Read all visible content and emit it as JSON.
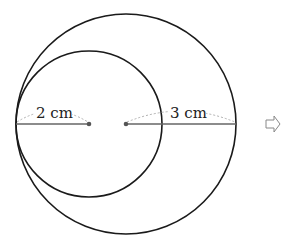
{
  "diagram": {
    "outer_circle": {
      "cx": 126,
      "cy": 124,
      "r": 110
    },
    "inner_circle": {
      "cx": 89,
      "cy": 124,
      "r": 73
    },
    "inner_radius_label": "2 cm",
    "outer_radius_label": "3 cm",
    "arrow_glyph": "⇨",
    "colors": {
      "stroke": "#1a1a1a",
      "radius_line": "#666666",
      "dashed_arc": "#b0b0b0"
    }
  }
}
